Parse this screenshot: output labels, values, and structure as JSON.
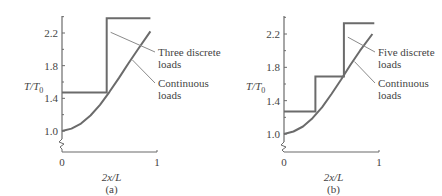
{
  "chart_data": [
    {
      "type": "line",
      "panel_label": "(a)",
      "xlabel": "2x/L",
      "ylabel": "T/T",
      "ylabel_sub": "0",
      "xlim": [
        0,
        1
      ],
      "ylim": [
        0.9,
        2.4
      ],
      "x_ticks": [
        {
          "value": 0,
          "label": "0"
        },
        {
          "value": 1,
          "label": "1"
        }
      ],
      "y_ticks": [
        {
          "value": 1.0,
          "label": "1.0"
        },
        {
          "value": 1.4,
          "label": "1.4"
        },
        {
          "value": 1.8,
          "label": "1.8"
        },
        {
          "value": 2.2,
          "label": "2.2"
        }
      ],
      "y_minor_ticks": [
        1.2,
        1.6,
        2.0,
        2.4
      ],
      "axis_break": true,
      "grid": false,
      "series": [
        {
          "name": "Three discrete loads",
          "kind": "step",
          "x": [
            0,
            0.47,
            0.47,
            0.93
          ],
          "y": [
            1.47,
            1.47,
            2.38,
            2.38
          ]
        },
        {
          "name": "Continuous loads",
          "kind": "curve",
          "x": [
            0,
            0.1,
            0.2,
            0.3,
            0.4,
            0.5,
            0.6,
            0.7,
            0.8,
            0.93
          ],
          "y": [
            1.0,
            1.03,
            1.09,
            1.19,
            1.32,
            1.48,
            1.65,
            1.83,
            2.0,
            2.22
          ]
        }
      ],
      "annotations": [
        {
          "lines": [
            "Three discrete",
            "loads"
          ],
          "target_series": 0
        },
        {
          "lines": [
            "Continuous",
            "loads"
          ],
          "target_series": 1
        }
      ]
    },
    {
      "type": "line",
      "panel_label": "(b)",
      "xlabel": "2x/L",
      "ylabel": "T/T",
      "ylabel_sub": "0",
      "xlim": [
        0,
        1
      ],
      "ylim": [
        0.9,
        2.4
      ],
      "x_ticks": [
        {
          "value": 0,
          "label": "0"
        },
        {
          "value": 1,
          "label": "1"
        }
      ],
      "y_ticks": [
        {
          "value": 1.0,
          "label": "1.0"
        },
        {
          "value": 1.4,
          "label": "1.4"
        },
        {
          "value": 1.8,
          "label": "1.8"
        },
        {
          "value": 2.2,
          "label": "2.2"
        }
      ],
      "y_minor_ticks": [
        1.2,
        1.6,
        2.0,
        2.4
      ],
      "axis_break": true,
      "grid": false,
      "series": [
        {
          "name": "Five discrete loads",
          "kind": "step",
          "x": [
            0,
            0.33,
            0.33,
            0.63,
            0.63,
            0.95
          ],
          "y": [
            1.27,
            1.27,
            1.69,
            1.69,
            2.33,
            2.33
          ]
        },
        {
          "name": "Continuous loads",
          "kind": "curve",
          "x": [
            0,
            0.1,
            0.2,
            0.3,
            0.4,
            0.5,
            0.6,
            0.7,
            0.8,
            0.93
          ],
          "y": [
            1.0,
            1.03,
            1.09,
            1.19,
            1.32,
            1.48,
            1.65,
            1.83,
            2.0,
            2.2
          ]
        }
      ],
      "annotations": [
        {
          "lines": [
            "Five discrete",
            "loads"
          ],
          "target_series": 0
        },
        {
          "lines": [
            "Continuous",
            "loads"
          ],
          "target_series": 1
        }
      ]
    }
  ]
}
